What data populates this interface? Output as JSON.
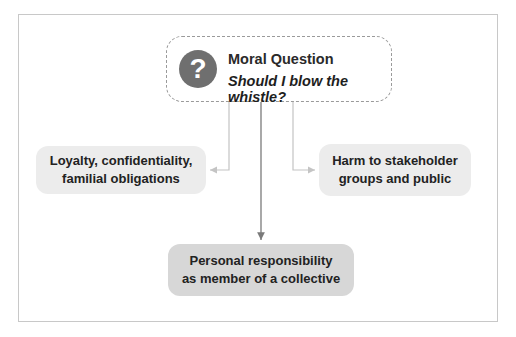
{
  "diagram": {
    "question": {
      "icon": "question-mark-icon",
      "icon_glyph": "?",
      "title": "Moral Question",
      "subtitle": "Should I blow the whistle?"
    },
    "nodes": [
      {
        "id": "left",
        "label_line1": "Loyalty, confidentiality,",
        "label_line2": "familial obligations"
      },
      {
        "id": "right",
        "label_line1": "Harm to stakeholder",
        "label_line2": "groups and public"
      },
      {
        "id": "bottom",
        "label_line1": "Personal responsibility",
        "label_line2": "as member of a collective"
      }
    ],
    "edges": [
      {
        "from": "question",
        "to": "left"
      },
      {
        "from": "question",
        "to": "right"
      },
      {
        "from": "question",
        "to": "bottom"
      }
    ],
    "colors": {
      "icon_fill": "#6f6f6f",
      "side_node_fill": "#ececec",
      "bottom_node_fill": "#d7d7d7",
      "dashed_border": "#9a9a9a",
      "frame_border": "#c8c8c8"
    }
  }
}
